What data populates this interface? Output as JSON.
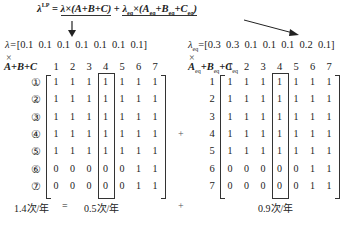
{
  "formula": {
    "lhs": "λ",
    "lhs_sup": "LP",
    "eq": " = ",
    "term1": "λ×(A+B+C)",
    "plus": " + ",
    "term2_lambda": "λ",
    "term2_lambda_sub": "eq",
    "term2_times": "×(",
    "term2_A": "A",
    "term2_A_sub": "eq",
    "term2_B": "+B",
    "term2_B_sub": "eq",
    "term2_C": "+C",
    "term2_C_sub": "eq",
    "term2_close": ")"
  },
  "left": {
    "lambda_label": "λ=",
    "lambda_values": "[0.1  0.1  0.1  0.1  0.1  0.1  0.1]",
    "times": "×",
    "matrix_label": "A+B+C",
    "col_headers": [
      "1",
      "2",
      "3",
      "4",
      "5",
      "6",
      "7"
    ],
    "row_labels": [
      "①",
      "②",
      "③",
      "④",
      "⑤",
      "⑥",
      "⑦"
    ],
    "rows": [
      [
        "1",
        "1",
        "1",
        "1",
        "1",
        "1",
        "1"
      ],
      [
        "1",
        "1",
        "1",
        "1",
        "1",
        "1",
        "1"
      ],
      [
        "1",
        "1",
        "1",
        "1",
        "1",
        "1",
        "1"
      ],
      [
        "1",
        "1",
        "1",
        "1",
        "1",
        "1",
        "1"
      ],
      [
        "1",
        "1",
        "1",
        "1",
        "1",
        "1",
        "1"
      ],
      [
        "0",
        "0",
        "0",
        "0",
        "0",
        "1",
        "1"
      ],
      [
        "0",
        "0",
        "0",
        "0",
        "0",
        "1",
        "1"
      ]
    ],
    "highlighted_column": 4,
    "result": "1.4次/年"
  },
  "right": {
    "lambda_label": "λ",
    "lambda_sub": "eq",
    "lambda_eq": "=",
    "lambda_values": "[0.3  0.3  0.1  0.1  0.1  0.2  0.1]",
    "times": "×",
    "matrix_label_A": "A",
    "matrix_label_B": "+B",
    "matrix_label_C": "+C",
    "matrix_label_sub": "eq",
    "col_headers": [
      "1",
      "2",
      "3",
      "4",
      "5",
      "6",
      "7"
    ],
    "row_labels": [
      "1",
      "2",
      "3",
      "4",
      "5",
      "6",
      "7"
    ],
    "rows": [
      [
        "1",
        "1",
        "1",
        "1",
        "1",
        "1",
        "1"
      ],
      [
        "1",
        "1",
        "1",
        "1",
        "1",
        "1",
        "1"
      ],
      [
        "1",
        "1",
        "1",
        "1",
        "1",
        "1",
        "1"
      ],
      [
        "1",
        "1",
        "1",
        "1",
        "1",
        "1",
        "1"
      ],
      [
        "1",
        "1",
        "1",
        "1",
        "1",
        "1",
        "1"
      ],
      [
        "0",
        "0",
        "0",
        "0",
        "0",
        "1",
        "1"
      ],
      [
        "0",
        "0",
        "0",
        "0",
        "0",
        "1",
        "1"
      ]
    ],
    "highlighted_column": 4,
    "result": "0.9次/年"
  },
  "between_plus": "+",
  "bottom": {
    "equals": "=",
    "middle_result": "0.5次/年",
    "plus": "+"
  }
}
